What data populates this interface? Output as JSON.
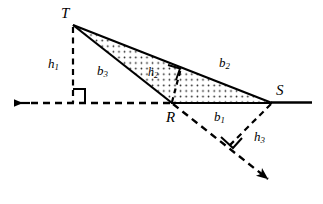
{
  "figure": {
    "type": "geometry-diagram",
    "colors": {
      "stroke": "#000000",
      "background": "#ffffff",
      "fill_pattern": "#000000"
    },
    "vertices": [
      {
        "name": "T",
        "label": "T",
        "x": 73,
        "y": 25,
        "label_x": 61,
        "label_y": 6
      },
      {
        "name": "R",
        "label": "R",
        "x": 172,
        "y": 103,
        "label_x": 166,
        "label_y": 110
      },
      {
        "name": "S",
        "label": "S",
        "x": 272,
        "y": 103,
        "label_x": 276,
        "label_y": 83
      }
    ],
    "segments": [
      {
        "name": "b1",
        "label": "b",
        "sub": "1",
        "label_x": 214,
        "label_y": 110,
        "from": "R",
        "to": "S",
        "style": "solid"
      },
      {
        "name": "b2",
        "label": "b",
        "sub": "2",
        "label_x": 219,
        "label_y": 56,
        "from": "T",
        "to": "S",
        "style": "solid"
      },
      {
        "name": "b3",
        "label": "b",
        "sub": "3",
        "label_x": 97,
        "label_y": 64,
        "from": "T",
        "to": "R",
        "style": "solid"
      }
    ],
    "altitudes": [
      {
        "name": "h1",
        "label": "h",
        "sub": "1",
        "label_x": 48,
        "label_y": 57,
        "from": "T",
        "foot_x": 73,
        "foot_y": 103,
        "style": "dashed"
      },
      {
        "name": "h2",
        "label": "h",
        "sub": "2",
        "label_x": 148,
        "label_y": 66,
        "from": "R",
        "foot_x": 181,
        "foot_y": 68,
        "style": "dashed"
      },
      {
        "name": "h3",
        "label": "h",
        "sub": "3",
        "label_x": 254,
        "label_y": 130,
        "from": "S",
        "foot_x": 229,
        "foot_y": 146,
        "style": "dashed"
      }
    ],
    "right_angles": [
      {
        "name": "right-angle-at-h1-foot",
        "x": 73,
        "y": 103
      },
      {
        "name": "right-angle-at-h2-foot",
        "x": 181,
        "y": 68
      },
      {
        "name": "right-angle-at-h3-foot",
        "x": 229,
        "y": 146
      }
    ],
    "rays": [
      {
        "name": "ray-left-from-R",
        "dir": "left",
        "arrow_x": 10,
        "arrow_y": 103
      },
      {
        "name": "ray-down-right-from-T",
        "dir": "down-right",
        "arrow_x": 277,
        "arrow_y": 184
      }
    ],
    "shaded_region": {
      "name": "triangle-TRS-shaded",
      "pattern": "dotted"
    }
  }
}
